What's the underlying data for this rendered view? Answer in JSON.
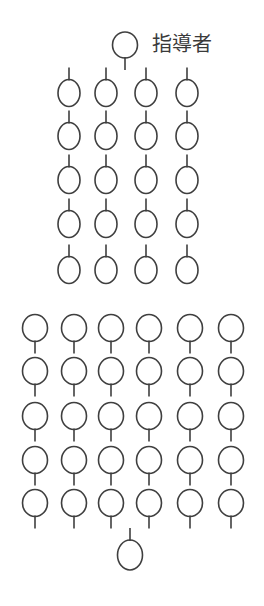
{
  "diagram": {
    "type": "seating-formation",
    "stroke_color": "#3f3f3f",
    "background": "#ffffff",
    "instructor": {
      "label": "指導者",
      "cx": 125,
      "cy": 45,
      "rx": 12.5,
      "ry": 13,
      "facing": "down",
      "label_x": 152,
      "label_y": 34
    },
    "upper_group": {
      "description": "4 columns x 5 rows, facing up toward instructor",
      "facing": "up",
      "columns_cx": [
        69,
        106,
        146,
        187
      ],
      "rows_cy": [
        93,
        136,
        180,
        224,
        270
      ],
      "rx": 11,
      "ry": 13.5
    },
    "lower_group": {
      "description": "6 columns x 5 rows, facing down",
      "facing": "down",
      "columns_cx": [
        35,
        74,
        111,
        149,
        190,
        231
      ],
      "rows_cy": [
        328,
        371,
        416,
        460,
        503
      ],
      "rx": 12.5,
      "ry": 13.5
    },
    "bottom_person": {
      "cx": 130,
      "cy": 555,
      "rx": 12.5,
      "ry": 15,
      "facing": "up"
    },
    "tick_length": 12
  }
}
